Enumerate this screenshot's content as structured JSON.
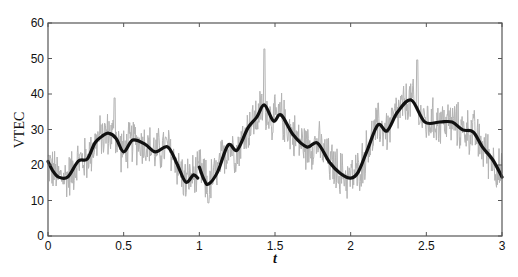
{
  "chart_data": {
    "type": "line",
    "title": "",
    "xlabel": "t",
    "ylabel": "VTEC",
    "xlim": [
      0,
      3
    ],
    "ylim": [
      0,
      60
    ],
    "xticks": [
      0,
      0.5,
      1,
      1.5,
      2,
      2.5,
      3
    ],
    "xtick_labels": [
      "0",
      "0.5",
      "1",
      "1.5",
      "2",
      "2.5",
      "3"
    ],
    "yticks": [
      0,
      10,
      20,
      30,
      40,
      50,
      60
    ],
    "ytick_labels": [
      "0",
      "10",
      "20",
      "30",
      "40",
      "50",
      "60"
    ],
    "grid": false,
    "legend": null,
    "series": [
      {
        "name": "raw VTEC (noisy)",
        "color": "#b3b3b3",
        "style": "thin noisy line",
        "description": "High-frequency noisy observations fluctuating roughly ±10 around the smoothed curve",
        "notable_points": [
          {
            "t": 0.44,
            "v": 38.9,
            "note": "local max"
          },
          {
            "t": 1.06,
            "v": 9.3,
            "note": "local min"
          },
          {
            "t": 1.43,
            "v": 52.7,
            "note": "global max"
          },
          {
            "t": 2.44,
            "v": 49.6,
            "note": "local max"
          }
        ],
        "noise_amplitude": 7,
        "samples": 900
      },
      {
        "name": "smoothed VTEC (segment 1)",
        "color": "#111111",
        "style": "thick line",
        "x": [
          0.0,
          0.03,
          0.07,
          0.13,
          0.2,
          0.26,
          0.31,
          0.36,
          0.4,
          0.45,
          0.5,
          0.56,
          0.64,
          0.71,
          0.79,
          0.85,
          0.91,
          0.96,
          0.99
        ],
        "y": [
          21.0,
          18.5,
          16.6,
          16.6,
          21.1,
          21.7,
          26.2,
          28.2,
          29.0,
          27.5,
          23.7,
          27.0,
          25.9,
          23.7,
          25.1,
          20.6,
          15.2,
          17.2,
          16.3
        ]
      },
      {
        "name": "smoothed VTEC (segment 2)",
        "color": "#111111",
        "style": "thick line",
        "x": [
          1.0,
          1.03,
          1.06,
          1.12,
          1.19,
          1.25,
          1.32,
          1.38,
          1.43,
          1.49,
          1.54,
          1.62,
          1.71,
          1.78,
          1.86,
          1.93,
          2.0,
          2.05,
          2.11,
          2.18,
          2.24,
          2.31,
          2.4,
          2.49,
          2.59,
          2.67,
          2.74,
          2.81,
          2.87,
          2.94,
          3.0
        ],
        "y": [
          19.4,
          16.0,
          14.6,
          18.0,
          25.6,
          24.2,
          30.4,
          33.5,
          36.9,
          32.4,
          34.1,
          28.5,
          25.1,
          26.2,
          20.8,
          17.7,
          16.3,
          18.0,
          24.2,
          31.3,
          29.6,
          34.9,
          38.3,
          32.1,
          32.1,
          32.1,
          29.9,
          29.3,
          25.1,
          21.4,
          16.6
        ]
      }
    ]
  },
  "plot_box": {
    "left": 48,
    "top": 23,
    "right": 502,
    "bottom": 236
  },
  "colors": {
    "axis": "#555555",
    "noise": "#b3b3b3",
    "smooth": "#111111",
    "background": "#ffffff"
  }
}
